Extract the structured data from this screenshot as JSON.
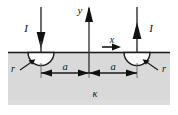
{
  "figure": {
    "medium_label": "κ",
    "axes": {
      "y_label": "y",
      "x_label": "x"
    },
    "currents": [
      {
        "label": "I",
        "direction": "down",
        "side": "left"
      },
      {
        "label": "I",
        "direction": "up",
        "side": "right"
      }
    ],
    "radii": [
      {
        "label": "r",
        "side": "left"
      },
      {
        "label": "r",
        "side": "right"
      }
    ],
    "dimensions": [
      {
        "label": "a",
        "side": "left"
      },
      {
        "label": "a",
        "side": "right"
      }
    ],
    "colors": {
      "ground_fill": "#d9d9d9",
      "line": "#1a1a1a",
      "electrode_fill": "#fdfdfd",
      "page_background": "#ffffff"
    },
    "geometry": {
      "ground_top_y": 52,
      "ground_left_x": 8,
      "ground_right_x": 170,
      "ground_bottom_y": 105,
      "origin_x": 89,
      "electrode_left_x": 41,
      "electrode_right_x": 137,
      "electrode_radius": 13,
      "dimension_line_y": 73
    }
  }
}
